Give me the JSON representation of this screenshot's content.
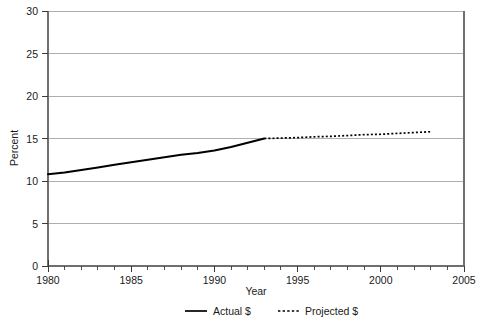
{
  "chart_data": {
    "type": "line",
    "title": "",
    "subtitle": "",
    "xlabel": "Year",
    "ylabel": "Percent",
    "xlim": [
      1980,
      2005
    ],
    "ylim": [
      0,
      30
    ],
    "grid": "horizontal",
    "legend_position": "bottom-center",
    "x_ticks_major": [
      1980,
      1985,
      1990,
      1995,
      2000,
      2005
    ],
    "x_ticks_major_labels": [
      "1980",
      "1985",
      "1990",
      "1995",
      "2000",
      "2005"
    ],
    "x_ticks_minor_step": 1,
    "y_ticks": [
      0,
      5,
      10,
      15,
      20,
      25,
      30
    ],
    "y_tick_labels": [
      "0",
      "5",
      "10",
      "15",
      "20",
      "25",
      "30"
    ],
    "series": [
      {
        "name": "Actual $",
        "style": "solid",
        "color": "#000000",
        "x": [
          1980,
          1981,
          1982,
          1983,
          1984,
          1985,
          1986,
          1987,
          1988,
          1989,
          1990,
          1991,
          1992,
          1993
        ],
        "values": [
          10.8,
          11.0,
          11.3,
          11.6,
          11.9,
          12.2,
          12.5,
          12.8,
          13.1,
          13.3,
          13.6,
          14.0,
          14.5,
          15.0
        ]
      },
      {
        "name": "Projected $",
        "style": "dotted",
        "color": "#000000",
        "x": [
          1993,
          1994,
          1995,
          1996,
          1997,
          1998,
          1999,
          2000,
          2001,
          2002,
          2003
        ],
        "values": [
          15.0,
          15.05,
          15.1,
          15.2,
          15.25,
          15.35,
          15.45,
          15.5,
          15.6,
          15.7,
          15.8
        ]
      }
    ]
  },
  "legend": {
    "entries": [
      {
        "label": "Actual $",
        "style": "solid"
      },
      {
        "label": "Projected $",
        "style": "dotted"
      }
    ]
  }
}
